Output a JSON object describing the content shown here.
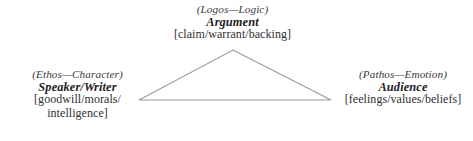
{
  "diagram": {
    "background_color": "#ffffff",
    "line_color": "#9a9a9a",
    "text_color": "#2b2b2b",
    "nodes": {
      "logos": {
        "appeal": "(Logos—Logic)",
        "role": "Argument",
        "detail": "[claim/warrant/backing]"
      },
      "ethos": {
        "appeal": "(Ethos—Character)",
        "role": "Speaker/Writer",
        "detail_line1": "[goodwill/morals/",
        "detail_line2": "intelligence]"
      },
      "pathos": {
        "appeal": "(Pathos—Emotion)",
        "role": "Audience",
        "detail": "[feelings/values/beliefs]"
      }
    },
    "geometry": {
      "apex_x": 233,
      "apex_y": 50,
      "left_x": 139,
      "left_y": 100,
      "right_x": 331,
      "right_y": 100
    }
  }
}
